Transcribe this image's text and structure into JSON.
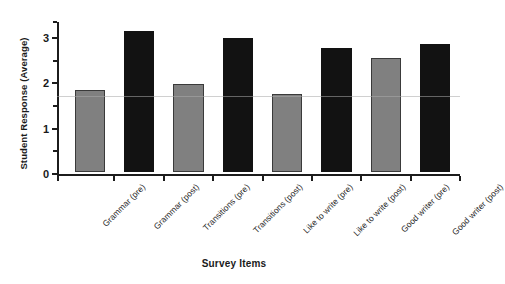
{
  "chart_data": {
    "type": "bar",
    "title": "",
    "xlabel": "Survey Items",
    "ylabel": "Student Response (Average)",
    "categories": [
      "Grammar (pre)",
      "Grammar (post)",
      "Transitions (pre)",
      "Transitions (post)",
      "Like to write (pre)",
      "Like to write (post)",
      "Good writer (pre)",
      "Good writer (post)"
    ],
    "values": [
      1.81,
      3.11,
      1.94,
      2.96,
      1.72,
      2.74,
      2.51,
      2.82
    ],
    "bar_colors": [
      "#808080",
      "#121212",
      "#808080",
      "#121212",
      "#808080",
      "#121212",
      "#808080",
      "#121212"
    ],
    "series_groups": [
      {
        "name": "pre",
        "color": "#808080"
      },
      {
        "name": "post",
        "color": "#121212"
      }
    ],
    "ylim": [
      0,
      3.35
    ],
    "ytick_values": [
      0,
      1,
      2,
      3
    ],
    "ytick_labels": [
      "0",
      "1",
      "2",
      "3"
    ],
    "yminor_tick_values": [
      0.5,
      1.5,
      2.5,
      3.35
    ],
    "grid": false,
    "legend": "none"
  }
}
